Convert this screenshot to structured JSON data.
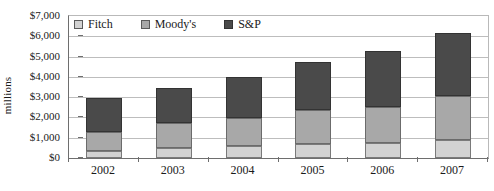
{
  "chart_data": {
    "type": "bar",
    "stacked": true,
    "title": "",
    "subtitle": "",
    "xlabel": "",
    "ylabel": "millions",
    "categories": [
      "2002",
      "2003",
      "2004",
      "2005",
      "2006",
      "2007"
    ],
    "series": [
      {
        "name": "Fitch",
        "color": "#d2d2d2",
        "values": [
          370,
          480,
          580,
          700,
          720,
          900
        ]
      },
      {
        "name": "Moody's",
        "color": "#a8a8a8",
        "values": [
          910,
          1250,
          1370,
          1680,
          1780,
          2180
        ]
      },
      {
        "name": "S&P",
        "color": "#4a4a4a",
        "values": [
          1700,
          1720,
          2050,
          2370,
          2800,
          3070
        ]
      }
    ],
    "totals": [
      2980,
      3450,
      4000,
      4750,
      5300,
      6150
    ],
    "ylim": [
      0,
      7000
    ],
    "ytick_step": 1000,
    "ytick_labels": [
      "$0",
      "$1,000",
      "$2,000",
      "$3,000",
      "$4,000",
      "$5,000",
      "$6,000",
      "$7,000"
    ],
    "ytick_values": [
      0,
      1000,
      2000,
      3000,
      4000,
      5000,
      6000,
      7000
    ],
    "grid": true,
    "grid_axis": "y",
    "legend_position": "top-left-inside",
    "legend_entries": [
      "Fitch",
      "Moody's",
      "S&P"
    ],
    "value_prefix": "$",
    "stack_order_bottom_to_top": [
      "Fitch",
      "Moody's",
      "S&P"
    ]
  }
}
